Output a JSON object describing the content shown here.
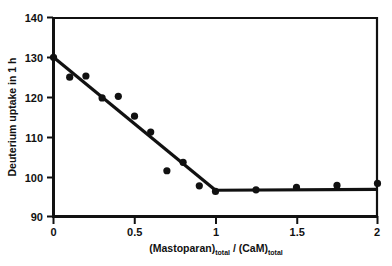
{
  "chart_data": {
    "type": "scatter",
    "title": "",
    "subtitle": "",
    "xlabel": "(Mastoparan)total / (CaM)total",
    "xlabel_parts": {
      "main1": "(Mastoparan)",
      "sub1": "total",
      "separator": " / ",
      "main2": "(CaM)",
      "sub2": "total"
    },
    "ylabel": "Deuterium uptake in 1 h",
    "xlim": [
      0,
      2
    ],
    "ylim": [
      90,
      140
    ],
    "xticks": [
      0,
      0.5,
      1,
      1.5,
      2
    ],
    "xtick_labels": [
      "0",
      "0.5",
      "1",
      "1.5",
      "2"
    ],
    "yticks": [
      90,
      100,
      110,
      120,
      130,
      140
    ],
    "ytick_labels": [
      "90",
      "100",
      "110",
      "120",
      "130",
      "140"
    ],
    "grid": false,
    "legend": false,
    "legend_position": "none",
    "marker_color": "#111111",
    "line_color": "#111111",
    "frame_color": "#111111",
    "background_color": "#ffffff",
    "series": [
      {
        "name": "Deuterium uptake",
        "marker": "filled-circle",
        "x": [
          0.0,
          0.1,
          0.2,
          0.3,
          0.4,
          0.5,
          0.6,
          0.7,
          0.8,
          0.9,
          1.0,
          1.25,
          1.5,
          1.75,
          2.0
        ],
        "values": [
          130.0,
          125.0,
          125.3,
          119.8,
          120.2,
          115.2,
          111.2,
          101.5,
          103.6,
          97.7,
          96.3,
          96.7,
          97.3,
          97.8,
          98.3
        ]
      }
    ],
    "fit_lines": [
      {
        "name": "descending-segment",
        "x": [
          0.0,
          1.0
        ],
        "y": [
          130.0,
          96.6
        ]
      },
      {
        "name": "plateau-segment",
        "x": [
          1.0,
          2.0
        ],
        "y": [
          96.6,
          96.8
        ]
      }
    ]
  }
}
